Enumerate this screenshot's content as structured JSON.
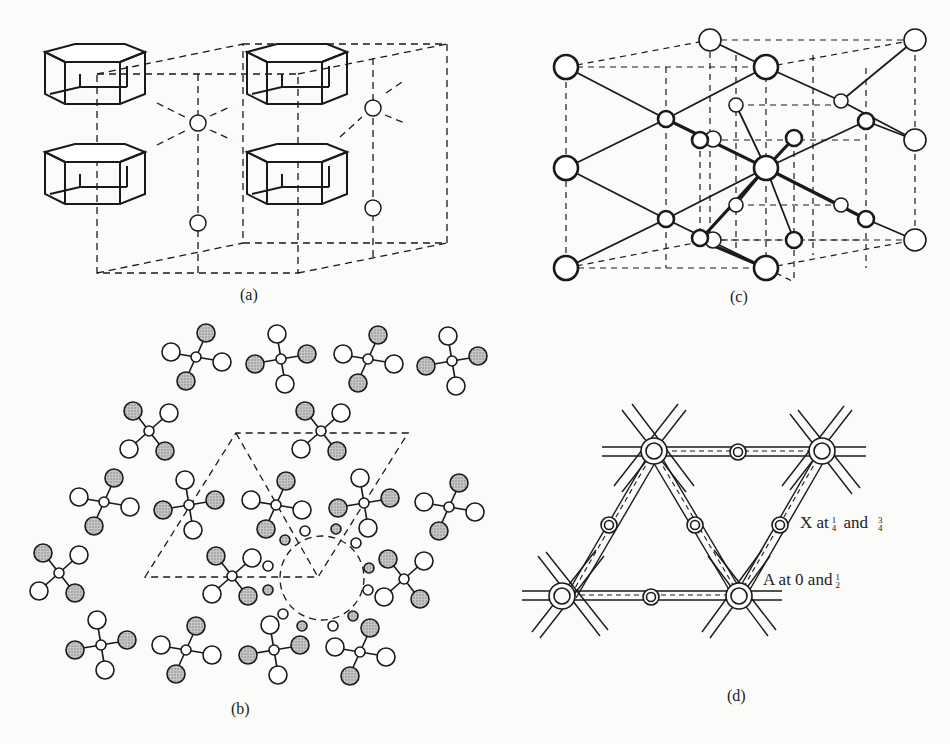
{
  "figure": {
    "panels": [
      {
        "id": "a",
        "label": "(a)"
      },
      {
        "id": "b",
        "label": "(b)"
      },
      {
        "id": "c",
        "label": "(c)"
      },
      {
        "id": "d",
        "label": "(d)"
      }
    ],
    "annotations": {
      "x_label": {
        "prefix": "X at",
        "frac1": {
          "num": "1",
          "den": "4"
        },
        "mid": "and",
        "frac2": {
          "num": "3",
          "den": "4"
        }
      },
      "a_label": {
        "prefix": "A at 0 and",
        "frac": {
          "num": "1",
          "den": "2"
        }
      }
    },
    "colors": {
      "ink": "#1a1a1a",
      "shaded": "#b8b8b8",
      "background": "#fbfbf9"
    }
  }
}
